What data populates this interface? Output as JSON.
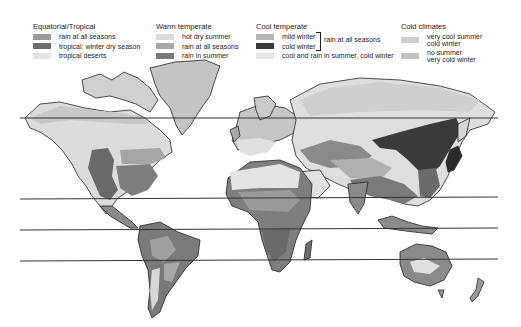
{
  "legend": {
    "groups": [
      {
        "title": "Equatorial/Tropical",
        "items": [
          {
            "label": "rain at all seasons",
            "color": "#9a9a9a"
          },
          {
            "label": "tropical: winter dry season",
            "color": "#6e6e6e"
          },
          {
            "label": "tropical deserts",
            "color": "#e4e4e4"
          }
        ]
      },
      {
        "title": "Warm temperate",
        "items": [
          {
            "label": "hot dry summer",
            "color": "#dcdcdc"
          },
          {
            "label": "rain at all seasons",
            "color": "#a8a8a8"
          },
          {
            "label": "rain in summer",
            "color": "#7a7a7a"
          }
        ]
      },
      {
        "title": "Cool temperate",
        "items": [
          {
            "label": "mild winter",
            "color": "#b4b4b4"
          },
          {
            "label": "cold winter",
            "color": "#3a3a3a"
          },
          {
            "label": "cool and rain in summer, cold winter",
            "color": "#e6e6e6"
          }
        ],
        "bracket_label": "rain at all seasons"
      },
      {
        "title": "Cold climates",
        "items": [
          {
            "label_line1": "very cool summer",
            "label_line2": "cold winter",
            "color": "#cfcfcf"
          },
          {
            "label_line1": "no summer",
            "label_line2": "very cold winter",
            "color": "#c2c2c2"
          }
        ]
      }
    ]
  },
  "map": {
    "latitude_lines_y": [
      118,
      199,
      230,
      261
    ],
    "colors": {
      "ocean": "#ffffff",
      "outline": "#222222",
      "line": "#333333"
    }
  }
}
